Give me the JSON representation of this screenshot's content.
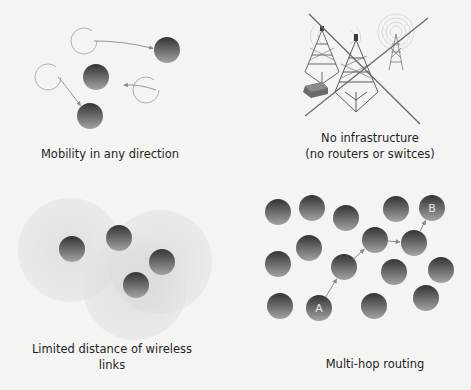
{
  "panels": {
    "mobility": {
      "caption": "Mobility in any direction",
      "moves": [
        {
          "from": [
            90,
            41
          ],
          "to": [
            167,
            50
          ],
          "ghost_r": 13
        },
        {
          "from": [
            54,
            77
          ],
          "to": [
            90,
            116
          ],
          "ghost_r": 13
        },
        {
          "from": [
            152,
            90
          ],
          "to": [
            110,
            83
          ],
          "ghost_r": 13
        }
      ],
      "nodes": [
        {
          "x": 167,
          "y": 50,
          "r": 13
        },
        {
          "x": 96,
          "y": 77,
          "r": 13
        },
        {
          "x": 90,
          "y": 116,
          "r": 13
        }
      ]
    },
    "infrastructure": {
      "caption_line1": "No infrastructure",
      "caption_line2": "(no routers or switces)"
    },
    "range": {
      "caption_line1": "Limited distance of wireless",
      "caption_line2": "links",
      "circles": [
        {
          "x": 70,
          "y": 250,
          "r": 52
        },
        {
          "x": 160,
          "y": 262,
          "r": 52
        },
        {
          "x": 135,
          "y": 288,
          "r": 52
        }
      ],
      "nodes": [
        {
          "x": 72,
          "y": 249,
          "r": 13
        },
        {
          "x": 119,
          "y": 238,
          "r": 13
        },
        {
          "x": 162,
          "y": 262,
          "r": 13
        },
        {
          "x": 136,
          "y": 285,
          "r": 13
        }
      ]
    },
    "routing": {
      "caption": "Multi-hop routing",
      "source_label": "A",
      "dest_label": "B",
      "nodes": [
        {
          "x": 278,
          "y": 212
        },
        {
          "x": 312,
          "y": 208
        },
        {
          "x": 346,
          "y": 218
        },
        {
          "x": 396,
          "y": 209
        },
        {
          "x": 432,
          "y": 208
        },
        {
          "x": 309,
          "y": 248
        },
        {
          "x": 375,
          "y": 240
        },
        {
          "x": 414,
          "y": 243
        },
        {
          "x": 278,
          "y": 264
        },
        {
          "x": 344,
          "y": 267
        },
        {
          "x": 394,
          "y": 272
        },
        {
          "x": 441,
          "y": 270
        },
        {
          "x": 280,
          "y": 306
        },
        {
          "x": 319,
          "y": 308
        },
        {
          "x": 374,
          "y": 306
        },
        {
          "x": 426,
          "y": 298
        }
      ],
      "node_r": 13,
      "path": [
        [
          319,
          308
        ],
        [
          344,
          267
        ],
        [
          375,
          240
        ],
        [
          414,
          243
        ],
        [
          432,
          208
        ]
      ]
    }
  },
  "colors": {
    "node_dark": "#3a3a3a",
    "node_light": "#9a9a9a",
    "ghost_stroke": "#a8a8a8",
    "arrow": "#8a8a8a",
    "range_fill": "#dcdcdc",
    "cross_line": "#6a6a6a",
    "caption": "#1f1f1f"
  }
}
